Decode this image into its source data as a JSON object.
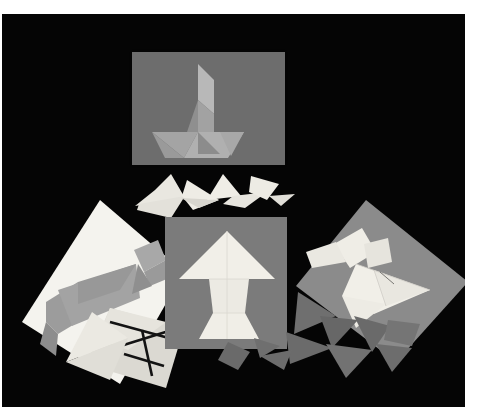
{
  "image": {
    "kind": "photograph",
    "subject": "tangram-puzzle-cards-and-pieces",
    "description": "Black-and-white photograph of several tangram puzzle cards and loose tangram pieces arranged on a black background, printed with a white border.",
    "print_border_color": "#ffffff",
    "background_color": "#050505"
  },
  "palette": {
    "black_background": "#050505",
    "print_white": "#ffffff",
    "card_dark_gray": "#6d6d6d",
    "card_mid_gray": "#7b7b7b",
    "card_light_gray": "#a9a9a9",
    "card_white": "#f2f1ec",
    "piece_white": "#eceae3",
    "piece_light_gray": "#c9c7c0",
    "piece_mid_gray": "#949290",
    "piece_dark_gray": "#5f5f5f",
    "ink_black": "#111111"
  },
  "cards": [
    {
      "id": "card-sailboat",
      "name": "sailboat-card",
      "position": "top-center",
      "card_color": "#6d6d6d",
      "figure": "sailboat",
      "figure_color": "#9a9a9a",
      "piece_count": 7
    },
    {
      "id": "card-arrow",
      "name": "arrow-card",
      "position": "center",
      "card_color": "#7b7b7b",
      "figure": "arrow-tree",
      "figure_color": "#f0eee8",
      "piece_count": 7
    },
    {
      "id": "card-cat",
      "name": "cat-card",
      "position": "left",
      "card_color": "#f2f1ec",
      "figure": "running-cat",
      "figure_color": "#9b9b9b",
      "piece_count": 7
    },
    {
      "id": "card-bird",
      "name": "bird-card",
      "position": "right",
      "card_color": "#8d8d8d",
      "figure": "bird",
      "figure_color": "#efece4",
      "piece_count": 7
    },
    {
      "id": "card-outline",
      "name": "outline-diagram-card",
      "position": "lower-left",
      "card_color": "#dedcd5",
      "figure": "square-tangram-outline",
      "figure_color": "#111111",
      "piece_count": 7
    }
  ],
  "loose_pieces": [
    {
      "group": "upper-scatter",
      "color": "#eceae3",
      "count": 8,
      "shapes": [
        "large-triangle",
        "large-triangle",
        "medium-triangle",
        "small-triangle",
        "small-triangle",
        "square",
        "parallelogram",
        "small-triangle"
      ]
    },
    {
      "group": "lower-right-scatter",
      "color": "#6e6e6e",
      "count": 7,
      "shapes": [
        "large-triangle",
        "large-triangle",
        "medium-triangle",
        "small-triangle",
        "small-triangle",
        "square",
        "parallelogram"
      ]
    },
    {
      "group": "lower-center-scatter",
      "color": "#7a7a7a",
      "count": 3,
      "shapes": [
        "square",
        "small-triangle",
        "small-triangle"
      ]
    }
  ]
}
